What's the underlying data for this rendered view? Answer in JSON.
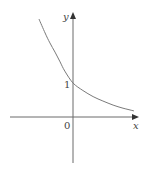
{
  "chart_data": {
    "type": "line",
    "title": "",
    "xlabel": "x",
    "ylabel": "y",
    "origin_label": "0",
    "y_tick_labels": [
      "1"
    ],
    "y_intercept": 1,
    "grid": false,
    "legend": null,
    "xlim": [
      -1.85,
      1.9
    ],
    "ylim": [
      -1.35,
      3.0
    ],
    "series": [
      {
        "name": "y = b^x",
        "x": [
          -1.0,
          -0.82,
          -0.68,
          -0.53,
          -0.38,
          -0.24,
          0.0,
          0.29,
          0.59,
          0.88,
          1.18,
          1.47,
          1.79
        ],
        "y": [
          2.88,
          2.47,
          2.18,
          1.91,
          1.62,
          1.35,
          1.0,
          0.78,
          0.6,
          0.47,
          0.35,
          0.26,
          0.18
        ]
      }
    ]
  },
  "labels": {
    "x_axis": "x",
    "y_axis": "y",
    "origin": "0",
    "y_tick": "1"
  },
  "layout": {
    "origin_px": [
      73,
      117
    ],
    "unit_px": 34,
    "x_axis_px": [
      10,
      138
    ],
    "y_axis_px": [
      163,
      13
    ]
  },
  "colors": {
    "axis": "#6b6b6b",
    "curve": "#7a7a7a",
    "text": "#444444"
  }
}
